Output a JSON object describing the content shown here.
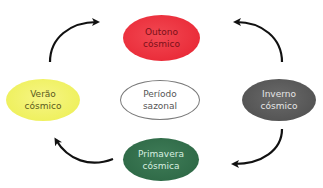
{
  "diagram": {
    "type": "cycle",
    "center": {
      "label_line1": "Período",
      "label_line2": "sazonal"
    },
    "nodes": [
      {
        "id": "outono",
        "label_line1": "Outono",
        "label_line2": "cósmico",
        "color": "#ea2d3a",
        "position": "top"
      },
      {
        "id": "inverno",
        "label_line1": "Inverno",
        "label_line2": "cósmico",
        "color": "#555555",
        "position": "right"
      },
      {
        "id": "primavera",
        "label_line1": "Primavera",
        "label_line2": "cósmica",
        "color": "#2f6a47",
        "position": "bottom"
      },
      {
        "id": "verao",
        "label_line1": "Verão",
        "label_line2": "cósmico",
        "color": "#eef05a",
        "position": "left"
      }
    ],
    "arrows": [
      {
        "from": "verao",
        "to": "outono"
      },
      {
        "from": "inverno",
        "to": "outono"
      },
      {
        "from": "inverno",
        "to": "primavera"
      },
      {
        "from": "primavera",
        "to": "verao"
      }
    ],
    "arrow_color": "#111111"
  }
}
